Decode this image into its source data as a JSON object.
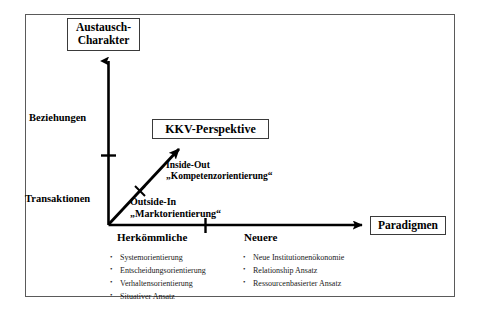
{
  "figure": {
    "title_boxes": {
      "y_axis_box": "Austausch-\nCharakter",
      "y_axis_box_line1": "Austausch-",
      "y_axis_box_line2": "Charakter",
      "center_box": "KKV-Perspektive",
      "x_axis_box": "Paradigmen"
    },
    "y_axis": {
      "upper_label": "Beziehungen",
      "lower_label": "Transaktionen",
      "tick_count": 1
    },
    "x_axis": {
      "left_label": "Herkömmliche",
      "right_label": "Neuere",
      "tick_count": 1
    },
    "diagonal_arrow": {
      "lower_caption_term": "Outside-In",
      "lower_caption_quote": "„Marktorientierung“",
      "upper_caption_term": "Inside-Out",
      "upper_caption_quote": "„Kompetenzorientierung“",
      "marker": "x-cross-marker"
    },
    "lists": {
      "left_column": [
        "Systemorientierung",
        "Entscheidungsorientierung",
        "Verhaltensorientierung",
        "Situativer Ansatz"
      ],
      "right_column": [
        "Neue Institutionenökonomie",
        "Relationship Ansatz",
        "Ressourcenbasierter Ansatz"
      ]
    },
    "colors": {
      "frame_border": "#5a5a5a",
      "axis": "#000000",
      "box_border": "#3a3a3a",
      "text": "#000000",
      "background": "#ffffff"
    }
  }
}
